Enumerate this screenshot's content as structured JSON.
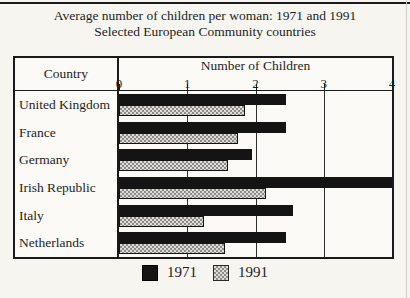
{
  "title": "Average number of children per woman: 1971 and 1991",
  "subtitle": "Selected European Community countries",
  "table": {
    "country_header": "Country",
    "value_axis_header": "Number of Children"
  },
  "legend": {
    "items": [
      {
        "label": "1971",
        "swatch": "solid-black"
      },
      {
        "label": "1991",
        "swatch": "gray-crosshatch"
      }
    ]
  },
  "colors": {
    "bar_1971": "#141414",
    "bar_1991_pattern_dark": "#8d8d8d",
    "bar_1991_pattern_light": "#dedbd5",
    "border": "#1a1a1a",
    "paper": "#f6f5f0"
  },
  "chart_data": {
    "type": "bar",
    "orientation": "horizontal",
    "title": "Average number of children per woman: 1971 and 1991",
    "subtitle": "Selected European Community countries",
    "xlabel": "Number of Children",
    "ylabel": "Country",
    "xlim": [
      0,
      4
    ],
    "x_ticks": [
      0,
      1,
      2,
      3,
      4
    ],
    "grid": "vertical gridlines at 1, 2 and 3",
    "legend_position": "bottom-center",
    "categories": [
      "United Kingdom",
      "France",
      "Germany",
      "Irish Republic",
      "Italy",
      "Netherlands"
    ],
    "series": [
      {
        "name": "1971",
        "values": [
          2.45,
          2.45,
          1.95,
          4.0,
          2.55,
          2.45
        ]
      },
      {
        "name": "1991",
        "values": [
          1.85,
          1.75,
          1.6,
          2.15,
          1.25,
          1.55
        ]
      }
    ]
  }
}
